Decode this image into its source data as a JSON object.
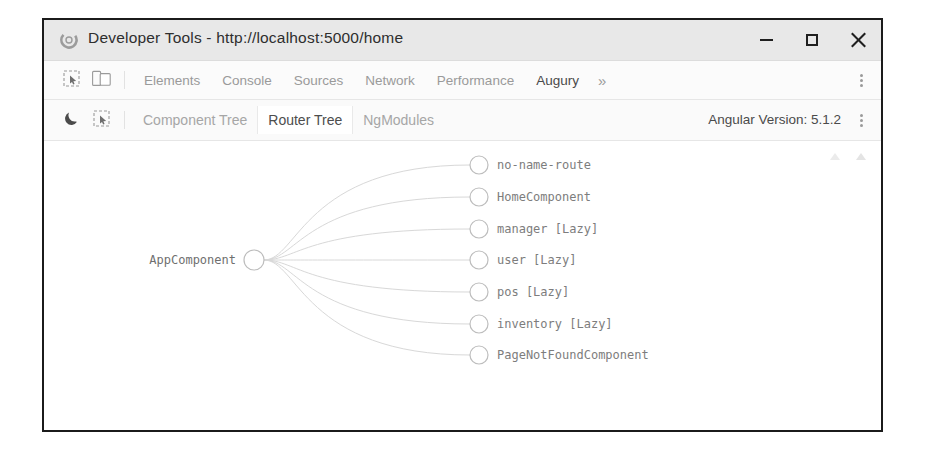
{
  "window": {
    "title": "Developer Tools - http://localhost:5000/home",
    "app_icon": "chrome-icon",
    "controls": {
      "minimize": "minimize-icon",
      "maximize": "maximize-icon",
      "close": "close-icon"
    }
  },
  "devtools_toolbar": {
    "icons": [
      {
        "name": "inspect-element-icon"
      },
      {
        "name": "device-toolbar-icon"
      }
    ],
    "tabs": [
      {
        "label": "Elements",
        "active": false
      },
      {
        "label": "Console",
        "active": false
      },
      {
        "label": "Sources",
        "active": false
      },
      {
        "label": "Network",
        "active": false
      },
      {
        "label": "Performance",
        "active": false
      },
      {
        "label": "Augury",
        "active": true
      }
    ],
    "overflow_label": "»",
    "menu_icon": "kebab-menu-icon"
  },
  "augury_toolbar": {
    "icons": [
      {
        "name": "dark-mode-moon-icon"
      },
      {
        "name": "inspect-component-icon"
      }
    ],
    "tabs": [
      {
        "label": "Component Tree",
        "active": false
      },
      {
        "label": "Router Tree",
        "active": true
      },
      {
        "label": "NgModules",
        "active": false
      }
    ],
    "angular_version_label": "Angular Version: 5.1.2",
    "menu_icon": "kebab-menu-icon"
  },
  "router_tree": {
    "controls": [
      {
        "name": "zoom-fit-icon"
      },
      {
        "name": "zoom-reset-icon"
      }
    ],
    "root": {
      "label": "AppComponent",
      "cx": 210,
      "cy": 119
    },
    "children": [
      {
        "label": "no-name-route",
        "cx": 435,
        "cy": 24
      },
      {
        "label": "HomeComponent",
        "cx": 435,
        "cy": 56
      },
      {
        "label": "manager [Lazy]",
        "cx": 435,
        "cy": 88
      },
      {
        "label": "user [Lazy]",
        "cx": 435,
        "cy": 119
      },
      {
        "label": "pos [Lazy]",
        "cx": 435,
        "cy": 151
      },
      {
        "label": "inventory [Lazy]",
        "cx": 435,
        "cy": 183
      },
      {
        "label": "PageNotFoundComponent",
        "cx": 435,
        "cy": 214
      }
    ],
    "node_radius": 9,
    "root_radius": 10,
    "edge_color": "#d8d8d8",
    "node_stroke": "#bdbdbd"
  }
}
